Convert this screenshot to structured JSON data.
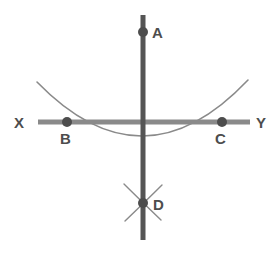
{
  "diagram": {
    "type": "geometric-construction",
    "colors": {
      "line_dark": "#555555",
      "line_light": "#8a8a8a",
      "arc": "#8a8a8a",
      "point_fill": "#4d4d4d",
      "label_text": "#4d4d4d",
      "background": "#ffffff"
    },
    "labels": {
      "a": "A",
      "b": "B",
      "c": "C",
      "d": "D",
      "x": "X",
      "y": "Y"
    },
    "points": [
      {
        "id": "A",
        "label": "A",
        "x": 143,
        "y": 32,
        "radius": 5
      },
      {
        "id": "B",
        "label": "B",
        "x": 67,
        "y": 122,
        "radius": 5
      },
      {
        "id": "C",
        "label": "C",
        "x": 222,
        "y": 122,
        "radius": 5
      },
      {
        "id": "D",
        "label": "D",
        "x": 143,
        "y": 203,
        "radius": 5
      }
    ],
    "label_positions": [
      {
        "id": "A",
        "x": 152,
        "y": 38
      },
      {
        "id": "B",
        "x": 60,
        "y": 143
      },
      {
        "id": "C",
        "x": 215,
        "y": 143
      },
      {
        "id": "D",
        "x": 152,
        "y": 210
      },
      {
        "id": "X",
        "x": 14,
        "y": 128
      },
      {
        "id": "Y",
        "x": 256,
        "y": 128
      }
    ],
    "lines": [
      {
        "id": "vertical-line-AD",
        "name": "perpendicular-line",
        "x1": 143,
        "y1": 15,
        "x2": 143,
        "y2": 240,
        "color": "#555555",
        "width": 5
      },
      {
        "id": "horizontal-line-XY",
        "name": "base-line",
        "x1": 38,
        "y1": 122,
        "x2": 250,
        "y2": 122,
        "color": "#8a8a8a",
        "width": 5
      }
    ],
    "arcs": [
      {
        "id": "main-arc",
        "name": "compass-arc-through-B-C",
        "path": "M 37 82 Q 143 191 248 80",
        "color": "#8a8a8a",
        "width": 1.6
      },
      {
        "id": "arc-mark-1",
        "name": "intersection-arc-upper-left",
        "path": "M 124 184 Q 136 196 160 219",
        "color": "#8a8a8a",
        "width": 1.4
      },
      {
        "id": "arc-mark-2",
        "name": "intersection-arc-upper-right",
        "path": "M 162 185 Q 150 197 126 220",
        "color": "#8a8a8a",
        "width": 1.4
      }
    ],
    "axis_endpoints": {
      "left_label": "X",
      "right_label": "Y"
    }
  }
}
